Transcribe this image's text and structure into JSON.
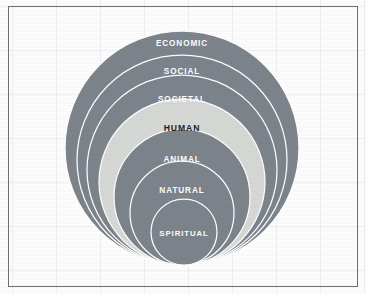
{
  "figure": {
    "background_color": "#fefefe",
    "border_color": "#6d6f72",
    "grid_color": "#96a0af",
    "ring_fill_dark": "#7d848c",
    "ring_fill_light": "#d6d9d6",
    "separator_color": "#ffffff",
    "label_color_on_dark": "#ffffff",
    "label_color_on_light": "#1d1d1d"
  },
  "chart_data": {
    "type": "diagram",
    "subtype": "nested-concentric-circles",
    "alignment": "bottom-tangent",
    "title": "",
    "layers": [
      {
        "label": "ECONOMIC",
        "order": 1,
        "cx": 182,
        "cy": 148,
        "r": 117,
        "fill": "#7d848c",
        "text_fill": "#ffffff",
        "label_y": 46,
        "font_size": 8.2,
        "highlight": false
      },
      {
        "label": "SOCIAL",
        "order": 2,
        "cx": 182,
        "cy": 160,
        "r": 105,
        "fill": "#7d848c",
        "text_fill": "#ffffff",
        "label_y": 74,
        "font_size": 8.2,
        "highlight": false
      },
      {
        "label": "SOCIETAL",
        "order": 3,
        "cx": 182,
        "cy": 170,
        "r": 95,
        "fill": "#7d848c",
        "text_fill": "#ffffff",
        "label_y": 102,
        "font_size": 8.2,
        "highlight": false
      },
      {
        "label": "HUMAN",
        "order": 4,
        "cx": 182,
        "cy": 182,
        "r": 83,
        "fill": "#d6d9d6",
        "text_fill": "#1d1d1d",
        "label_y": 131,
        "font_size": 8.6,
        "highlight": true
      },
      {
        "label": "ANIMAL",
        "order": 5,
        "cx": 182,
        "cy": 197,
        "r": 68,
        "fill": "#7d848c",
        "text_fill": "#ffffff",
        "label_y": 162,
        "font_size": 8.2,
        "highlight": false
      },
      {
        "label": "NATURAL",
        "order": 6,
        "cx": 182,
        "cy": 213,
        "r": 52,
        "fill": "#7d848c",
        "text_fill": "#ffffff",
        "label_y": 193,
        "font_size": 8.2,
        "highlight": false
      },
      {
        "label": "SPIRITUAL",
        "order": 7,
        "cx": 184,
        "cy": 232,
        "r": 33,
        "fill": "#7d848c",
        "text_fill": "#ffffff",
        "label_y": 236,
        "font_size": 7.8,
        "highlight": false
      }
    ]
  }
}
